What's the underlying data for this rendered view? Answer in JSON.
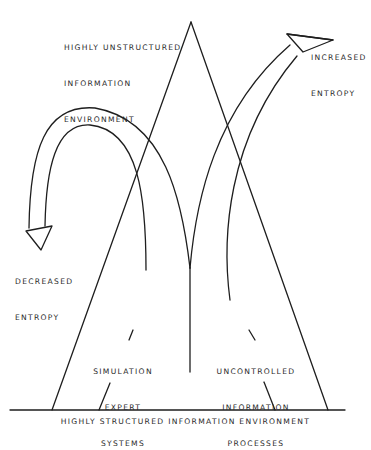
{
  "diagram": {
    "type": "triangle-with-entropy-arrows",
    "labels": {
      "top": [
        "HIGHLY UNSTRUCTURED",
        "INFORMATION",
        "ENVIRONMENT"
      ],
      "increased": [
        "INCREASED",
        "ENTROPY"
      ],
      "decreased": [
        "DECREASED",
        "ENTROPY"
      ],
      "left_inner": [
        "SIMULATION",
        "EXPERT",
        "SYSTEMS"
      ],
      "right_inner": [
        "UNCONTROLLED",
        "INFORMATION",
        "PROCESSES"
      ],
      "base": "HIGHLY STRUCTURED INFORMATION ENVIRONMENT"
    },
    "colors": {
      "stroke": "#1e1e1e",
      "text": "#2a2a2a",
      "background": "#ffffff"
    }
  }
}
